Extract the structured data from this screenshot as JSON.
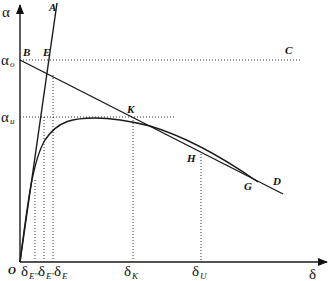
{
  "diagram": {
    "type": "line-diagram",
    "axes": {
      "y_label": "α",
      "x_label": "δ",
      "origin_label": "O"
    },
    "y_ticks": [
      {
        "main": "α",
        "sub": "o",
        "y": 60
      },
      {
        "main": "α",
        "sub": "u",
        "y": 117
      }
    ],
    "x_ticks": [
      {
        "main": "δ",
        "sub": "E''",
        "x": 35
      },
      {
        "main": "δ",
        "sub": "E'",
        "x": 44
      },
      {
        "main": "δ",
        "sub": "E",
        "x": 53
      },
      {
        "main": "δ",
        "sub": "K",
        "x": 133
      },
      {
        "main": "δ",
        "sub": "U",
        "x": 201
      }
    ],
    "points": {
      "A": "A",
      "B": "B",
      "C": "C",
      "D": "D",
      "E": "E",
      "G": "G",
      "H": "H",
      "K": "K"
    },
    "lines": [
      {
        "name": "OA",
        "from": "O",
        "to": "A",
        "style": "solid"
      },
      {
        "name": "BD",
        "from": "B",
        "to": "D",
        "style": "solid"
      },
      {
        "name": "BC",
        "from": "B",
        "to": "C",
        "style": "dotted"
      },
      {
        "name": "curve",
        "description": "rises from O, peaks near α_u, decreases and merges with BD toward G",
        "style": "solid"
      }
    ]
  }
}
